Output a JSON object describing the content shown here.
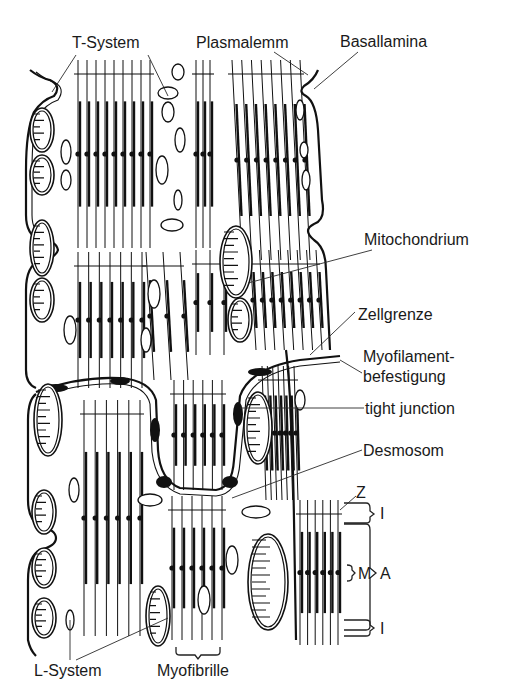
{
  "figure": {
    "labels": {
      "t_system": "T-System",
      "plasmalemm": "Plasmalemm",
      "basallamina": "Basallamina",
      "mitochondrium": "Mitochondrium",
      "zellgrenze": "Zellgrenze",
      "myofilament_1": "Myofilament-",
      "myofilament_2": "befestigung",
      "tight_junction": "tight junction",
      "desmosom": "Desmosom",
      "z_line": "Z",
      "i_band_top": "I",
      "m_line": "M",
      "a_band": "A",
      "i_band_bottom": "I",
      "l_system": "L-System",
      "myofibrille": "Myofibrille"
    }
  }
}
